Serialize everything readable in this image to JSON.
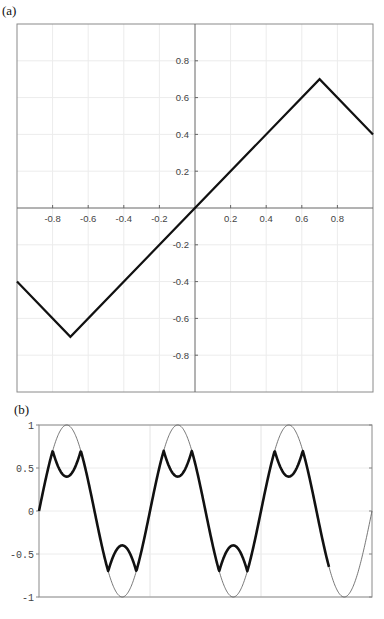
{
  "panels": {
    "a": {
      "label": "(a)"
    },
    "b": {
      "label": "(b)"
    }
  },
  "chart_data": [
    {
      "type": "line",
      "panel": "(a)",
      "title": "",
      "xlabel": "",
      "ylabel": "",
      "xlim": [
        -1,
        1
      ],
      "ylim": [
        -1,
        1
      ],
      "grid": true,
      "axes_through_origin": true,
      "x_ticks": [
        -0.8,
        -0.6,
        -0.4,
        -0.2,
        0.2,
        0.4,
        0.6,
        0.8
      ],
      "x_tick_labels": [
        "-0.8",
        "-0.6",
        "-0.4",
        "-0.2",
        "0.2",
        "0.4",
        "0.6",
        "0.8"
      ],
      "y_ticks": [
        0.8,
        0.6,
        0.4,
        0.2,
        -0.2,
        -0.4,
        -0.6,
        -0.8
      ],
      "y_tick_labels": [
        "0.8",
        "0.6",
        "0.4",
        "0.2",
        "-0.2",
        "-0.4",
        "-0.6",
        "-0.8"
      ],
      "series": [
        {
          "name": "clipped saturating function",
          "color": "#111111",
          "x": [
            -1.0,
            -0.7,
            0.7,
            1.0
          ],
          "y": [
            -0.4,
            -0.7,
            0.7,
            0.4
          ]
        }
      ]
    },
    {
      "type": "line",
      "panel": "(b)",
      "title": "",
      "xlabel": "",
      "ylabel": "",
      "xlim": [
        0,
        6.0
      ],
      "ylim": [
        -1,
        1
      ],
      "grid": true,
      "y_ticks": [
        1,
        0.5,
        0,
        -0.5,
        -1
      ],
      "y_tick_labels": [
        "1",
        "0.5",
        "0",
        "-0.5",
        "-1"
      ],
      "series": [
        {
          "name": "input sine",
          "color": "#555555",
          "linewidth": "thin",
          "function": "sin(2*pi*x/2)",
          "periods": 3,
          "amplitude": 1
        },
        {
          "name": "output through nonlinearity",
          "color": "#111111",
          "linewidth": "thick",
          "description": "sine passed through panel (a) function: peaks at ±0.7, dips to ±0.4 at sine extrema",
          "peak": 0.7,
          "dip": 0.4,
          "periods": 2.75
        }
      ]
    }
  ]
}
